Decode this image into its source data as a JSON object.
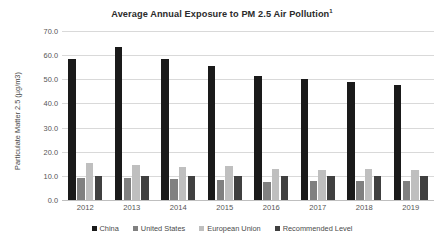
{
  "chart_data": {
    "type": "bar",
    "title": "Average Annual Exposure to PM 2.5 Air Pollution",
    "title_superscript": "1",
    "xlabel": "",
    "ylabel": "Particulate Matter 2.5 (µg/m3)",
    "ylim": [
      0,
      70
    ],
    "ytick_step": 10,
    "ytick_labels": [
      "70.0",
      "60.0",
      "50.0",
      "40.0",
      "30.0",
      "20.0",
      "10.0",
      "0.0"
    ],
    "ytick_values": [
      70,
      60,
      50,
      40,
      30,
      20,
      10,
      0
    ],
    "grid": true,
    "legend_position": "bottom",
    "categories": [
      "2012",
      "2013",
      "2014",
      "2015",
      "2016",
      "2017",
      "2018",
      "2019"
    ],
    "series": [
      {
        "name": "China",
        "color": "#1a1a1a",
        "values": [
          58.5,
          63.5,
          58.5,
          55.5,
          51.5,
          50.0,
          49.0,
          47.5
        ]
      },
      {
        "name": "United States",
        "color": "#808080",
        "values": [
          9.3,
          9.0,
          8.7,
          8.2,
          7.6,
          7.9,
          7.9,
          7.7
        ]
      },
      {
        "name": "European Union",
        "color": "#bfbfbf",
        "values": [
          15.2,
          14.5,
          13.8,
          14.0,
          12.8,
          12.6,
          12.8,
          12.4
        ]
      },
      {
        "name": "Recommended Level",
        "color": "#404040",
        "values": [
          10.0,
          10.0,
          10.0,
          10.0,
          10.0,
          10.0,
          10.0,
          10.0
        ]
      }
    ]
  }
}
